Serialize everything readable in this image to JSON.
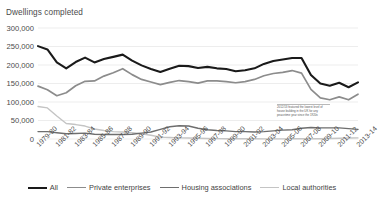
{
  "chart_data": {
    "type": "line",
    "title": "Dwellings completed",
    "xlabel": "",
    "ylabel": "Dwellings completed",
    "ylim": [
      0,
      300000
    ],
    "ytick_values": [
      0,
      50000,
      100000,
      150000,
      200000,
      250000,
      300000
    ],
    "ytick_labels": [
      "0",
      "50,000",
      "100,000",
      "150,000",
      "200,000",
      "250,000",
      "300,000"
    ],
    "grid": true,
    "legend_position": "bottom",
    "x": [
      "1979-80",
      "1980-81",
      "1981-82",
      "1982-83",
      "1983-84",
      "1984-85",
      "1985-86",
      "1986-87",
      "1987-88",
      "1988-89",
      "1989-90",
      "1990-91",
      "1991-92",
      "1992-93",
      "1993-94",
      "1994-95",
      "1995-96",
      "1996-97",
      "1997-98",
      "1998-99",
      "1999-00",
      "2000-01",
      "2001-02",
      "2002-03",
      "2003-04",
      "2004-05",
      "2005-06",
      "2006-07",
      "2007-08",
      "2008-09",
      "2009-10",
      "2010-11",
      "2011-12",
      "2012-13",
      "2013-14"
    ],
    "xtick_labels": [
      "1979-80",
      "1981-82",
      "1983-84",
      "1985-86",
      "1987-88",
      "1989-90",
      "1991-92",
      "1993-94",
      "1995-96",
      "1997-98",
      "1999-00",
      "2001-02",
      "2003-04",
      "2005-06",
      "2007-08",
      "2009-10",
      "2011-12",
      "2013-14"
    ],
    "series": [
      {
        "name": "All",
        "color": "#1a1a1a",
        "values": [
          251000,
          242000,
          207000,
          191000,
          208000,
          220000,
          207000,
          216000,
          222000,
          228000,
          212000,
          199000,
          189000,
          181000,
          190000,
          198000,
          197000,
          192000,
          195000,
          191000,
          189000,
          183000,
          186000,
          191000,
          203000,
          211000,
          215000,
          219000,
          219000,
          173000,
          150000,
          144000,
          152000,
          140000,
          153000
        ]
      },
      {
        "name": "Private enterprises",
        "color": "#8c8c8c",
        "values": [
          143000,
          133000,
          117000,
          125000,
          144000,
          156000,
          157000,
          170000,
          179000,
          190000,
          174000,
          161000,
          154000,
          147000,
          153000,
          158000,
          155000,
          151000,
          157000,
          157000,
          155000,
          152000,
          155000,
          161000,
          171000,
          177000,
          180000,
          185000,
          178000,
          134000,
          111000,
          106000,
          114000,
          106000,
          121000
        ]
      },
      {
        "name": "Housing associations",
        "color": "#6e6e6e",
        "values": [
          20000,
          20000,
          17000,
          14000,
          15000,
          16000,
          13000,
          12000,
          12000,
          12000,
          13000,
          16000,
          19000,
          26000,
          33000,
          36000,
          35000,
          29000,
          25000,
          23000,
          22000,
          20000,
          20000,
          19000,
          20000,
          22000,
          24000,
          25000,
          29000,
          31000,
          30000,
          30000,
          30000,
          28000,
          26000
        ]
      },
      {
        "name": "Local authorities",
        "color": "#c4c4c4",
        "values": [
          88000,
          84000,
          62000,
          42000,
          39000,
          35000,
          27000,
          23000,
          20000,
          19000,
          17000,
          14000,
          10000,
          5000,
          4000,
          3000,
          2500,
          2000,
          1500,
          1000,
          800,
          700,
          600,
          500,
          400,
          300,
          400,
          500,
          500,
          600,
          800,
          1500,
          2000,
          2500,
          3000
        ]
      }
    ],
    "annotation": {
      "text": "2012/13 featured the lowest level of house building in the UK for any peacetime year since the 1920s"
    }
  },
  "legend": {
    "items": [
      {
        "label": "All",
        "color": "#1a1a1a",
        "width": "2.6px"
      },
      {
        "label": "Private enterprises",
        "color": "#8c8c8c",
        "width": "1.9px"
      },
      {
        "label": "Housing associations",
        "color": "#6e6e6e",
        "width": "1.6px"
      },
      {
        "label": "Local authorities",
        "color": "#c4c4c4",
        "width": "1.6px"
      }
    ]
  },
  "axis": {
    "gridline_color": "#e8e8e8"
  }
}
